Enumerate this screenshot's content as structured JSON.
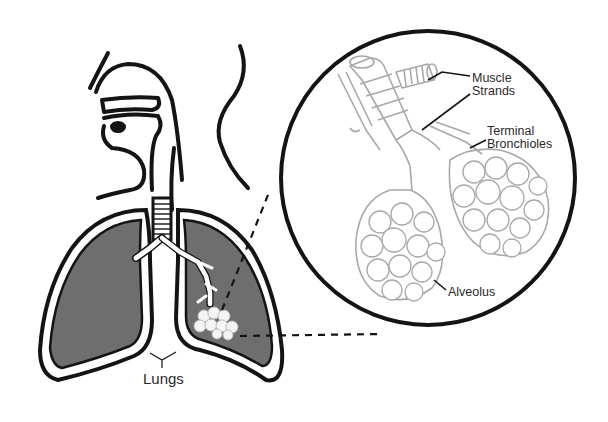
{
  "diagram": {
    "colors": {
      "background": "#ffffff",
      "outline": "#141414",
      "lung_fill": "#6e6e6e",
      "detail_line": "#a8a8a8",
      "label_text": "#2a2a2a"
    },
    "labels": {
      "lungs": "Lungs",
      "muscle_strands_line1": "Muscle",
      "muscle_strands_line2": "Strands",
      "terminal_bronchioles_line1": "Terminal",
      "terminal_bronchioles_line2": "Bronchioles",
      "alveolus": "Alveolus"
    },
    "magnifier": {
      "shape": "circle",
      "center": [
        428,
        178
      ],
      "radius": 147
    }
  }
}
